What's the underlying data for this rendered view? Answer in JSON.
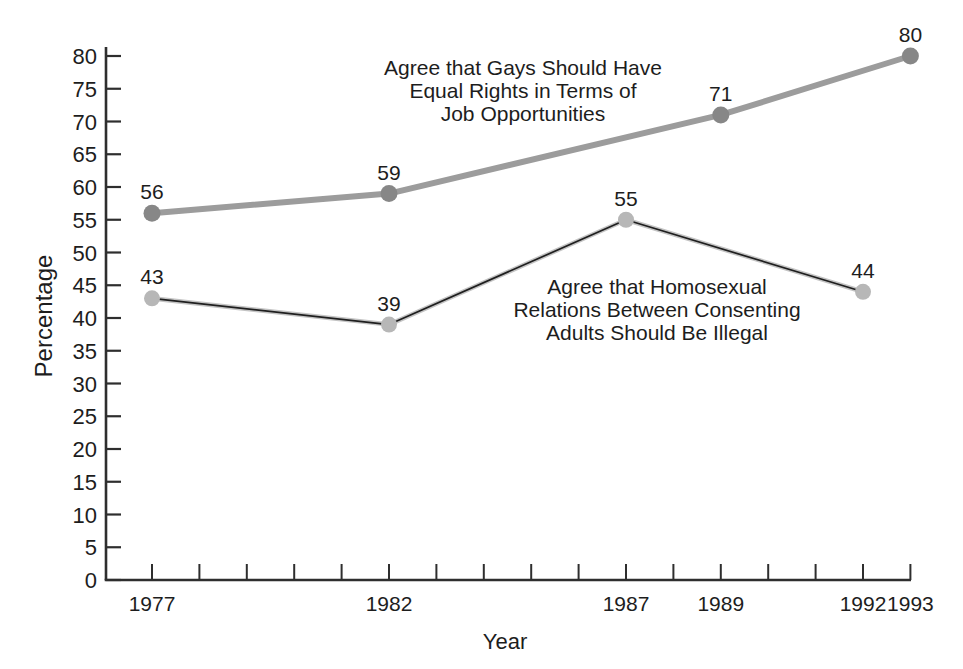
{
  "chart_data": {
    "type": "line",
    "title": "",
    "xlabel": "Year",
    "ylabel": "Percentage",
    "grid": false,
    "y_axis": {
      "min": 0,
      "max": 80,
      "tick_step": 5
    },
    "x_axis": {
      "tick_year_start": 1977,
      "tick_year_end": 1993,
      "labeled_ticks": [
        "1977",
        "1982",
        "1987",
        "1989",
        "1992",
        "1993"
      ]
    },
    "series": [
      {
        "id": "equal-rights",
        "name": "Agree that Gays Should Have Equal Rights in Terms of Job Opportunities",
        "points": [
          {
            "x": 1977,
            "y": 56
          },
          {
            "x": 1982,
            "y": 59
          },
          {
            "x": 1989,
            "y": 71
          },
          {
            "x": 1993,
            "y": 80
          }
        ],
        "line_color": "#9c9c9c",
        "marker_color": "#878787",
        "line_width": 6
      },
      {
        "id": "illegal",
        "name": "Agree that Homosexual Relations Between Consenting Adults Should Be Illegal",
        "points": [
          {
            "x": 1977,
            "y": 43
          },
          {
            "x": 1982,
            "y": 39
          },
          {
            "x": 1987,
            "y": 55
          },
          {
            "x": 1992,
            "y": 44
          }
        ],
        "line_color": "#1f1f1f",
        "underlay_color": "#c4c4c4",
        "marker_color": "#b7b7b7",
        "line_width": 1.7
      }
    ],
    "annotations": [
      {
        "series": "equal-rights",
        "lines": [
          "Agree that Gays Should Have",
          "Equal Rights in Terms of",
          "Job Opportunities"
        ]
      },
      {
        "series": "illegal",
        "lines": [
          "Agree that Homosexual",
          "Relations Between Consenting",
          "Adults Should Be Illegal"
        ]
      }
    ],
    "colors": {
      "axis": "#2e2e2e",
      "text": "#1d1d1d"
    }
  }
}
